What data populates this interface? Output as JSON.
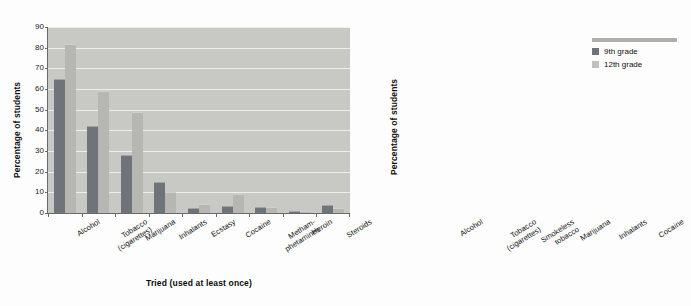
{
  "legend": {
    "position": "top-right",
    "entries": [
      {
        "label": "9th grade",
        "color": "#6e7479"
      },
      {
        "label": "12th grade",
        "color": "#c0c0bc"
      }
    ]
  },
  "chart_data": [
    {
      "type": "bar",
      "title": "",
      "xlabel": "Tried (used at least once)",
      "ylabel": "Percentage of students",
      "ylim": [
        0,
        90
      ],
      "yticks": [
        0,
        10,
        20,
        30,
        40,
        50,
        60,
        70,
        80,
        90
      ],
      "grid": true,
      "categories": [
        "Alcohol",
        "Tobacco\n(cigarettes)",
        "Marijuana",
        "Inhalants",
        "Ecstasy",
        "Cocaine",
        "Metham-\nphetamines",
        "Heroin",
        "Steroids"
      ],
      "series": [
        {
          "name": "9th grade",
          "color": "#6e7479",
          "values": [
            65,
            42,
            28,
            15,
            2.5,
            3.5,
            3,
            1.2,
            4
          ]
        },
        {
          "name": "12th grade",
          "color": "#b6b6b2",
          "values": [
            82,
            59,
            49,
            10,
            4.5,
            9,
            3,
            1.2,
            2.5
          ]
        }
      ]
    },
    {
      "type": "bar",
      "title": "",
      "xlabel": "Use (at least once in prior 30 days)",
      "ylabel": "Percentage of students",
      "ylim": [
        0,
        60
      ],
      "yticks": [
        0,
        10,
        20,
        30,
        40,
        50,
        60
      ],
      "grid": true,
      "categories": [
        "Alcohol",
        "Tobacco\n(cigarettes)",
        "Smokeless\ntobacco",
        "Marijuana",
        "Inhalants",
        "Cocaine"
      ],
      "series": [
        {
          "name": "9th grade",
          "color": "#6e7479",
          "values": [
            35.5,
            14,
            6,
            13.5,
            4.5,
            1
          ]
        },
        {
          "name": "12th grade",
          "color": "#b6b6b2",
          "values": [
            55,
            26,
            8,
            24,
            0.8,
            2.5
          ]
        }
      ]
    }
  ]
}
